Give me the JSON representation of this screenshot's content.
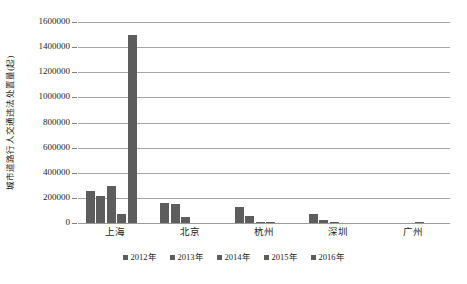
{
  "chart_data": {
    "type": "bar",
    "title": "",
    "xlabel": "",
    "ylabel": "城市道路行人交通违法处置量(起)",
    "ylim": [
      0,
      1600000
    ],
    "ytick_step": 200000,
    "yticks": [
      "1600000",
      "1400000",
      "1200000",
      "1000000",
      "800000",
      "600000",
      "400000",
      "200000",
      "0"
    ],
    "grid": true,
    "legend_position": "bottom",
    "categories": [
      "上海",
      "北京",
      "杭州",
      "深圳",
      "广州"
    ],
    "series": [
      {
        "name": "2012年",
        "values": [
          255000,
          160000,
          130000,
          75000,
          0
        ]
      },
      {
        "name": "2013年",
        "values": [
          215000,
          150000,
          55000,
          22000,
          0
        ]
      },
      {
        "name": "2014年",
        "values": [
          295000,
          45000,
          10000,
          8000,
          0
        ]
      },
      {
        "name": "2015年",
        "values": [
          70000,
          0,
          6000,
          0,
          8000
        ]
      },
      {
        "name": "2016年",
        "values": [
          1500000,
          0,
          0,
          0,
          0
        ]
      }
    ],
    "bar_color": "#5d5d5d",
    "gridline_color": "#a6a6a6"
  }
}
